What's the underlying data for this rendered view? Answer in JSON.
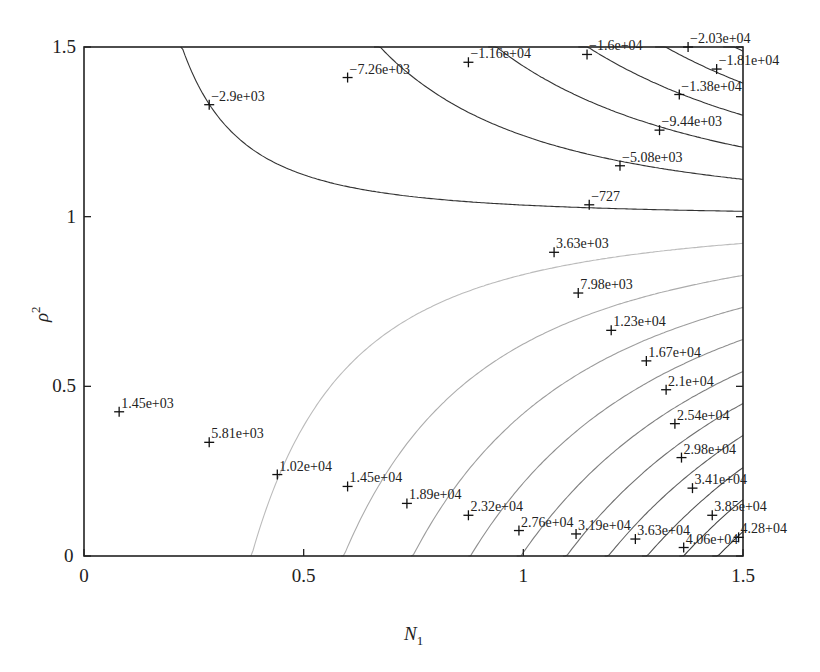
{
  "chart_data": {
    "type": "contour",
    "title": "",
    "xlabel": "N_1",
    "ylabel": "rho^2",
    "xlabel_display": "N",
    "xlabel_sub": "1",
    "ylabel_display": "ρ",
    "ylabel_sup": "2",
    "xlim": [
      0,
      1.5
    ],
    "ylim": [
      0,
      1.5
    ],
    "xticks": [
      0,
      0.5,
      1,
      1.5
    ],
    "xtick_labels": [
      "0",
      "0.5",
      "1",
      "1.5"
    ],
    "yticks": [
      0,
      0.5,
      1,
      1.5
    ],
    "ytick_labels": [
      "0",
      "0.5",
      "1",
      "1.5"
    ],
    "origin_extra_label": "0",
    "grid": false,
    "legend": null,
    "negative_contour_color": "#333333",
    "positive_contour_color_low": "#c8c8c8",
    "positive_contour_color_high": "#333333",
    "contour_labels": [
      {
        "text": "−2.9e+03",
        "value": -2900,
        "x": 0.285,
        "y": 1.33
      },
      {
        "text": "−7.26e+03",
        "value": -7260,
        "x": 0.6,
        "y": 1.41
      },
      {
        "text": "−1.16e+04",
        "value": -11600,
        "x": 0.875,
        "y": 1.455
      },
      {
        "text": "−1.6e+04",
        "value": -16000,
        "x": 1.145,
        "y": 1.478
      },
      {
        "text": "−2.03e+04",
        "value": -20300,
        "x": 1.375,
        "y": 1.5
      },
      {
        "text": "−1.81e+04",
        "value": -18100,
        "x": 1.44,
        "y": 1.435
      },
      {
        "text": "−1.38e+04",
        "value": -13800,
        "x": 1.355,
        "y": 1.36
      },
      {
        "text": "−9.44e+03",
        "value": -9440,
        "x": 1.31,
        "y": 1.255
      },
      {
        "text": "−5.08e+03",
        "value": -5080,
        "x": 1.22,
        "y": 1.15
      },
      {
        "text": "−727",
        "value": -727,
        "x": 1.15,
        "y": 1.035
      },
      {
        "text": "3.63e+03",
        "value": 3630,
        "x": 1.07,
        "y": 0.895
      },
      {
        "text": "7.98e+03",
        "value": 7980,
        "x": 1.125,
        "y": 0.775
      },
      {
        "text": "1.23e+04",
        "value": 12300,
        "x": 1.2,
        "y": 0.665
      },
      {
        "text": "1.67e+04",
        "value": 16700,
        "x": 1.28,
        "y": 0.575
      },
      {
        "text": "2.1e+04",
        "value": 21000,
        "x": 1.325,
        "y": 0.49
      },
      {
        "text": "2.54e+04",
        "value": 25400,
        "x": 1.345,
        "y": 0.39
      },
      {
        "text": "2.98e+04",
        "value": 29800,
        "x": 1.36,
        "y": 0.29
      },
      {
        "text": "3.41e+04",
        "value": 34100,
        "x": 1.385,
        "y": 0.2
      },
      {
        "text": "3.85e+04",
        "value": 38500,
        "x": 1.43,
        "y": 0.12
      },
      {
        "text": "4.28+04",
        "value": 42800,
        "x": 1.49,
        "y": 0.055
      },
      {
        "text": "4.06e+04",
        "value": 40600,
        "x": 1.365,
        "y": 0.025
      },
      {
        "text": "3.63e+04",
        "value": 36300,
        "x": 1.255,
        "y": 0.05
      },
      {
        "text": "3.19e+04",
        "value": 31900,
        "x": 1.12,
        "y": 0.065
      },
      {
        "text": "2.76e+04",
        "value": 27600,
        "x": 0.99,
        "y": 0.075
      },
      {
        "text": "2.32e+04",
        "value": 23200,
        "x": 0.875,
        "y": 0.12
      },
      {
        "text": "1.89e+04",
        "value": 18900,
        "x": 0.735,
        "y": 0.155
      },
      {
        "text": "1.45e+04",
        "value": 14500,
        "x": 0.6,
        "y": 0.205
      },
      {
        "text": "1.02e+04",
        "value": 10200,
        "x": 0.44,
        "y": 0.24
      },
      {
        "text": "5.81e+03",
        "value": 5810,
        "x": 0.285,
        "y": 0.335
      },
      {
        "text": "1.45e+03",
        "value": 1450,
        "x": 0.08,
        "y": 0.425
      }
    ]
  }
}
